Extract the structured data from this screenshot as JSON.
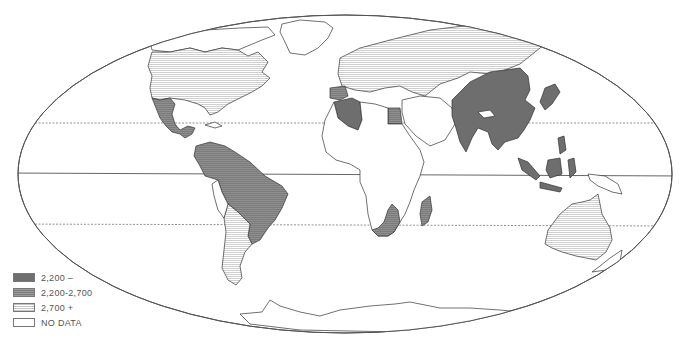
{
  "map": {
    "projection": "elliptical world map (Mollweide-like)",
    "lines": [
      "Tropic of Cancer (dashed)",
      "Equator (solid)",
      "Tropic of Capricorn (dashed)"
    ],
    "regions": [
      {
        "name": "North America (USA/Canada)",
        "class": "2,700 +"
      },
      {
        "name": "Mexico & Central America",
        "class": "2,200-2,700"
      },
      {
        "name": "Northern South America / Brazil",
        "class": "2,200-2,700"
      },
      {
        "name": "Southern South America (Argentina/Chile)",
        "class": "2,700 +"
      },
      {
        "name": "Europe & USSR",
        "class": "2,700 +"
      },
      {
        "name": "Iberia",
        "class": "2,200-2,700"
      },
      {
        "name": "Algeria",
        "class": "2,200 –"
      },
      {
        "name": "Egypt",
        "class": "2,200-2,700"
      },
      {
        "name": "Southern Africa",
        "class": "2,200-2,700"
      },
      {
        "name": "Madagascar",
        "class": "2,200-2,700"
      },
      {
        "name": "South/East Asia (India, China, SE Asia, Indonesia)",
        "class": "2,200 –"
      },
      {
        "name": "Australia",
        "class": "2,700 +"
      },
      {
        "name": "Greenland / Middle East / most of Africa / Antarctica",
        "class": "NO DATA"
      }
    ]
  },
  "legend": {
    "items": [
      {
        "label": "2,200 –",
        "fill": "#6e6e6e",
        "pattern": "solid"
      },
      {
        "label": "2,200-2,700",
        "fill": "#7c7c7c",
        "pattern": "striped"
      },
      {
        "label": "2,700 +",
        "fill": "#e6e6e6",
        "pattern": "striped"
      },
      {
        "label": "NO DATA",
        "fill": "#ffffff",
        "pattern": "none"
      }
    ]
  }
}
